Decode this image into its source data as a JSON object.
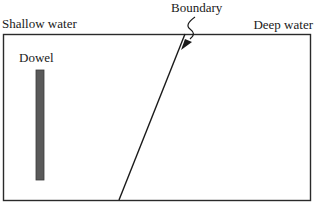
{
  "diagram": {
    "type": "ripple-tank-refraction-setup",
    "labels": {
      "shallow_water": "Shallow water",
      "deep_water": "Deep water",
      "boundary": "Boundary",
      "dowel": "Dowel"
    },
    "colors": {
      "outline": "#2a2a2a",
      "dowel_fill": "#5a5a5a",
      "background": "#ffffff"
    },
    "geometry": {
      "tank": {
        "x": 3,
        "y": 34,
        "width": 307,
        "height": 166
      },
      "boundary_line": {
        "x1": 185,
        "y1": 34,
        "x2": 119,
        "y2": 200
      },
      "dowel": {
        "x": 36,
        "y": 70,
        "width": 8,
        "height": 110
      },
      "boundary_pointer": {
        "from": [
          193,
          18
        ],
        "to": [
          181,
          49
        ]
      }
    }
  }
}
